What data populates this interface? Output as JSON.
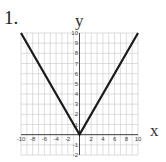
{
  "problem": {
    "number_label": "1."
  },
  "chart_data": {
    "type": "line",
    "title": "",
    "xlabel": "x",
    "ylabel": "y",
    "xlim": [
      -10,
      10
    ],
    "ylim": [
      -2,
      10
    ],
    "grid": true,
    "x_ticks": [
      -10,
      -8,
      -6,
      -4,
      -2,
      2,
      4,
      6,
      8,
      10
    ],
    "y_ticks": [
      -2,
      -1,
      1,
      2,
      3,
      4,
      5,
      6,
      7,
      8,
      9,
      10
    ],
    "series": [
      {
        "name": "y = |x|",
        "x": [
          -10,
          0,
          10
        ],
        "y": [
          10,
          0,
          10
        ],
        "color": "#1a1a1a"
      }
    ]
  }
}
